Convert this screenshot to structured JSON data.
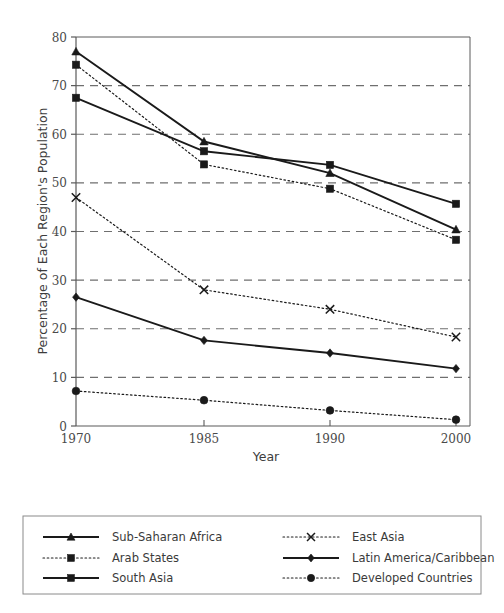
{
  "chart_data": {
    "type": "line",
    "title": "",
    "xlabel": "Year",
    "ylabel": "Percentage of Each Region's Population",
    "categories": [
      "1970",
      "1985",
      "1990",
      "2000"
    ],
    "x": [
      1970,
      1985,
      1990,
      2000
    ],
    "xtick_labels": [
      "1970",
      "1985",
      "1990",
      "2000"
    ],
    "ytick_labels": [
      "0",
      "10",
      "20",
      "30",
      "40",
      "50",
      "60",
      "70",
      "80"
    ],
    "yticks": [
      0,
      10,
      20,
      30,
      40,
      50,
      60,
      70,
      80
    ],
    "ylim": [
      0,
      80
    ],
    "grid": "horizontal-dashed",
    "legend_position": "bottom",
    "series": [
      {
        "name": "Sub-Saharan Africa",
        "marker": "triangle",
        "line": "solid",
        "color": "#1a1a1a",
        "values": [
          77.0,
          58.5,
          52.0,
          40.4
        ]
      },
      {
        "name": "Arab States",
        "marker": "square",
        "line": "dotted",
        "color": "#1a1a1a",
        "values": [
          74.3,
          53.8,
          48.8,
          38.3
        ]
      },
      {
        "name": "South Asia",
        "marker": "square",
        "line": "solid",
        "color": "#1a1a1a",
        "values": [
          67.5,
          56.5,
          53.7,
          45.7
        ]
      },
      {
        "name": "East Asia",
        "marker": "cross",
        "line": "dotted",
        "color": "#1a1a1a",
        "values": [
          47.0,
          28.0,
          24.0,
          18.3
        ]
      },
      {
        "name": "Latin America/Caribbean",
        "marker": "diamond",
        "line": "solid",
        "color": "#1a1a1a",
        "values": [
          26.5,
          17.6,
          15.0,
          11.8
        ]
      },
      {
        "name": "Developed Countries",
        "marker": "circle",
        "line": "dotted",
        "color": "#1a1a1a",
        "values": [
          7.2,
          5.3,
          3.2,
          1.3
        ]
      }
    ]
  },
  "legend": {
    "entries": [
      {
        "label": "Sub-Saharan Africa",
        "column": 0,
        "row": 0
      },
      {
        "label": "Arab States",
        "column": 0,
        "row": 1
      },
      {
        "label": "South Asia",
        "column": 0,
        "row": 2
      },
      {
        "label": "East Asia",
        "column": 1,
        "row": 0
      },
      {
        "label": "Latin America/Caribbean",
        "column": 1,
        "row": 1
      },
      {
        "label": "Developed Countries",
        "column": 1,
        "row": 2
      }
    ]
  },
  "style": {
    "ink": "#1a1a1a",
    "grid": "#6f6f6f",
    "axis": "#5a5a5a",
    "text": "#3a3a3a",
    "background": "#ffffff"
  }
}
